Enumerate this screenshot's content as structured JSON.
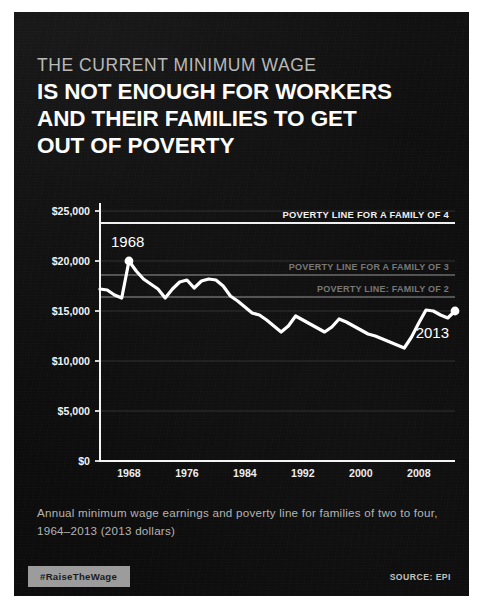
{
  "poster": {
    "kicker": "THE CURRENT MINIMUM WAGE",
    "headline_lines": [
      "IS NOT ENOUGH FOR WORKERS",
      "AND THEIR FAMILIES TO GET",
      "OUT OF POVERTY"
    ],
    "caption": "Annual minimum wage earnings and poverty line for families of two to four, 1964–2013 (2013 dollars)",
    "hashtag": "#RaiseTheWage",
    "source": "SOURCE: EPI",
    "colors": {
      "background": "#0d0d0d",
      "headline": "#fdfdfd",
      "kicker": "#b9b9b9",
      "line": "#ffffff",
      "caption": "#b4b4b4",
      "badge_bg": "#9c9c9c",
      "poverty_line_4": "#f0f0f0",
      "poverty_line_3": "#8e8e8e",
      "poverty_line_2": "#8e8e8e"
    }
  },
  "chart_data": {
    "type": "line",
    "xlabel": "",
    "ylabel": "",
    "xlim": [
      1964,
      2013
    ],
    "ylim": [
      0,
      25000
    ],
    "grid": true,
    "legend_position": "inline-annotations",
    "y_ticks": [
      0,
      5000,
      10000,
      15000,
      20000,
      25000
    ],
    "y_tick_labels": [
      "$0",
      "$5,000",
      "$10,000",
      "$15,000",
      "$20,000",
      "$25,000"
    ],
    "x_ticks": [
      1968,
      1976,
      1984,
      1992,
      2000,
      2008
    ],
    "x_tick_labels": [
      "1968",
      "1976",
      "1984",
      "1992",
      "2000",
      "2008"
    ],
    "series": [
      {
        "name": "Annual minimum wage earnings",
        "color": "#ffffff",
        "x": [
          1964,
          1965,
          1966,
          1967,
          1968,
          1969,
          1970,
          1971,
          1972,
          1973,
          1974,
          1975,
          1976,
          1977,
          1978,
          1979,
          1980,
          1981,
          1982,
          1983,
          1984,
          1985,
          1986,
          1987,
          1988,
          1989,
          1990,
          1991,
          1992,
          1993,
          1994,
          1995,
          1996,
          1997,
          1998,
          1999,
          2000,
          2001,
          2002,
          2003,
          2004,
          2005,
          2006,
          2007,
          2008,
          2009,
          2010,
          2011,
          2012,
          2013
        ],
        "values": [
          17200,
          17100,
          16600,
          16300,
          20000,
          19000,
          18200,
          17700,
          17200,
          16300,
          17200,
          17900,
          18100,
          17300,
          18000,
          18200,
          18100,
          17500,
          16500,
          16000,
          15400,
          14800,
          14600,
          14100,
          13500,
          12900,
          13500,
          14500,
          14100,
          13700,
          13300,
          12900,
          13400,
          14200,
          13900,
          13500,
          13100,
          12700,
          12500,
          12200,
          11900,
          11600,
          11300,
          12400,
          13800,
          15100,
          15000,
          14600,
          14300,
          15000
        ]
      }
    ],
    "reference_lines": [
      {
        "name": "POVERTY LINE FOR A FAMILY OF 4",
        "value": 23800,
        "color": "#f0f0f0",
        "emphasis": "high"
      },
      {
        "name": "POVERTY LINE FOR A FAMILY OF 3",
        "value": 18600,
        "color": "#8e8e8e",
        "emphasis": "low"
      },
      {
        "name": "POVERTY LINE: FAMILY OF 2",
        "value": 16400,
        "color": "#8e8e8e",
        "emphasis": "low"
      }
    ],
    "annotations": [
      {
        "label": "1968",
        "x": 1968,
        "y": 20000,
        "marker": true
      },
      {
        "label": "2013",
        "x": 2013,
        "y": 15000,
        "marker": true
      }
    ]
  }
}
